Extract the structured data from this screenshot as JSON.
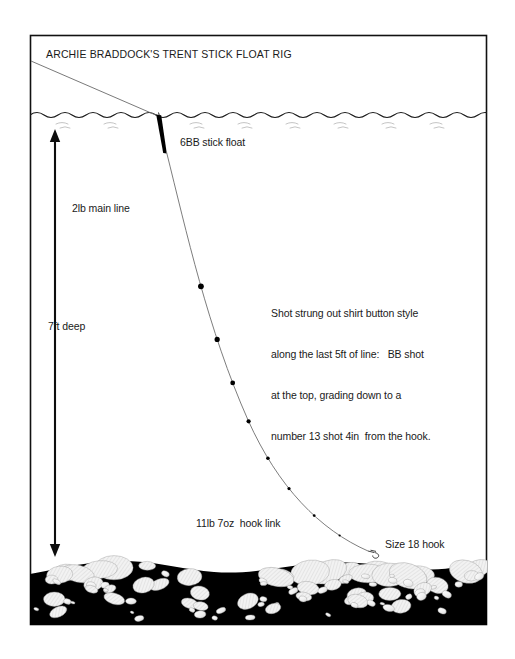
{
  "diagram": {
    "title": "ARCHIE BRADDOCK'S TRENT STICK FLOAT RIG",
    "labels": {
      "float": "6BB stick float",
      "main_line": "2lb main line",
      "depth": "7ft deep",
      "hook_link": "11lb 7oz  hook link",
      "hook": "Size 18 hook"
    },
    "note_lines": [
      "Shot strung out shirt button style",
      "along the last 5ft of line:   BB shot",
      "at the top, grading down to a",
      "number 13 shot 4in  from the hook."
    ],
    "colors": {
      "ink": "#1a1a1a",
      "line": "#555555",
      "riverbed": "#000000",
      "stone_fill": "#efefef",
      "paper": "#ffffff"
    },
    "elements": {
      "frame": "diagram-border",
      "water_surface": "wavy-water-line",
      "riverbed": "gravel-riverbed",
      "depth_arrow": "double-headed-depth-arrow",
      "float": "stick-float-body",
      "rod_line": "line-to-rod",
      "hook_line": "curved-hook-length",
      "shots": [
        {
          "t": 0.3,
          "r": 2.9
        },
        {
          "t": 0.42,
          "r": 2.6
        },
        {
          "t": 0.52,
          "r": 2.4
        },
        {
          "t": 0.61,
          "r": 2.1
        },
        {
          "t": 0.7,
          "r": 1.8
        },
        {
          "t": 0.78,
          "r": 1.6
        },
        {
          "t": 0.86,
          "r": 1.35
        },
        {
          "t": 0.93,
          "r": 1.1
        }
      ]
    }
  }
}
